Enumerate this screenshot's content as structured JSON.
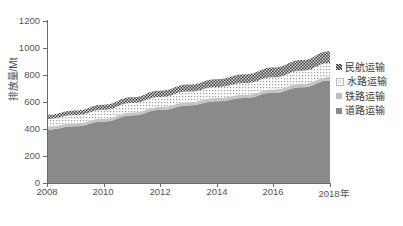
{
  "chart_data": {
    "type": "area",
    "stacked": true,
    "title": "",
    "xlabel": "",
    "ylabel": "排放量/Mt",
    "x": [
      2008,
      2009,
      2010,
      2011,
      2012,
      2013,
      2014,
      2015,
      2016,
      2017,
      2018
    ],
    "xlim": [
      2008,
      2018
    ],
    "ylim": [
      0,
      1200
    ],
    "xticks": [
      "2008",
      "2010",
      "2012",
      "2014",
      "2016",
      "2018年"
    ],
    "xtick_values": [
      2008,
      2010,
      2012,
      2014,
      2016,
      2018
    ],
    "yticks": [
      "0",
      "200",
      "400",
      "600",
      "800",
      "1000",
      "1200"
    ],
    "ytick_values": [
      0,
      200,
      400,
      600,
      800,
      1000,
      1200
    ],
    "grid": false,
    "legend_position": "right",
    "series": [
      {
        "name": "道路运输",
        "order": 1,
        "color": "#8c8c8c",
        "pattern": "solid",
        "values": [
          395,
          420,
          455,
          500,
          540,
          575,
          605,
          630,
          668,
          710,
          760
        ]
      },
      {
        "name": "铁路运输",
        "order": 2,
        "color": "#c9c9c9",
        "pattern": "solid-light",
        "values": [
          22,
          22,
          22,
          23,
          23,
          24,
          24,
          24,
          25,
          25,
          26
        ]
      },
      {
        "name": "水路运输",
        "order": 3,
        "color": "#f2f2f2",
        "pattern": "dotted",
        "values": [
          58,
          62,
          66,
          70,
          74,
          78,
          82,
          86,
          90,
          96,
          102
        ]
      },
      {
        "name": "民航运输",
        "order": 4,
        "color": "#4a4a4a",
        "pattern": "checker",
        "values": [
          30,
          33,
          37,
          42,
          47,
          52,
          58,
          65,
          72,
          80,
          88
        ]
      }
    ],
    "totals": [
      505,
      537,
      580,
      635,
      684,
      729,
      769,
      805,
      855,
      911,
      976
    ]
  },
  "axis": {
    "y_title": "排放量/Mt",
    "x_tick_labels": [
      "2008",
      "2010",
      "2012",
      "2014",
      "2016",
      "2018年"
    ],
    "y_tick_labels": [
      "1200",
      "1000",
      "800",
      "600",
      "400",
      "200",
      "0"
    ]
  },
  "legend": {
    "items": [
      {
        "label": "民航运输",
        "color": "#4a4a4a"
      },
      {
        "label": "水路运输",
        "color": "#efefef"
      },
      {
        "label": "铁路运输",
        "color": "#b9b9b9"
      },
      {
        "label": "道路运输",
        "color": "#8c8c8c"
      }
    ]
  },
  "caption": {
    "text": ""
  }
}
